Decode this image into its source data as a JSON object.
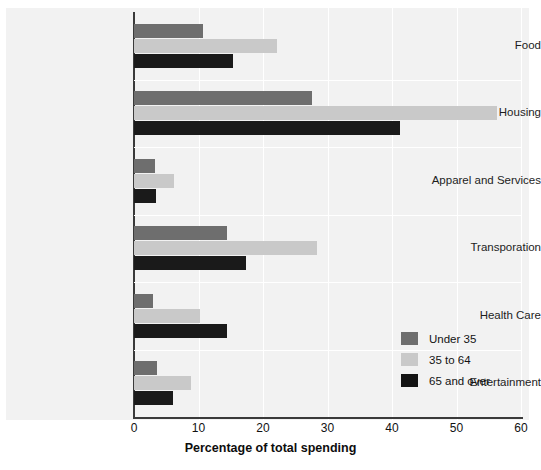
{
  "chart_data": {
    "type": "bar",
    "orientation": "horizontal",
    "title": "",
    "xlabel": "Percentage of total spending",
    "ylabel": "",
    "xlim": [
      0,
      60
    ],
    "xticks": [
      0,
      10,
      20,
      30,
      40,
      50,
      60
    ],
    "xtick_labels": [
      "0",
      "10",
      "20",
      "30",
      "40",
      "50",
      "60"
    ],
    "grid": true,
    "grid_axis": "x",
    "legend_position": "lower right",
    "categories": [
      "Food",
      "Housing",
      "Apparel and Services",
      "Transporation",
      "Health Care",
      "Entertainment"
    ],
    "series": [
      {
        "name": "Under 35",
        "color": "#6e6e6e",
        "values": [
          10.7,
          27.6,
          3.3,
          14.4,
          2.9,
          3.6
        ]
      },
      {
        "name": "35 to 64",
        "color": "#c9c9c9",
        "values": [
          22.2,
          56.3,
          6.2,
          28.4,
          10.2,
          8.8
        ]
      },
      {
        "name": "65 and over",
        "color": "#141414",
        "values": [
          15.3,
          41.2,
          3.4,
          17.4,
          14.4,
          6.1
        ]
      }
    ]
  },
  "legend": {
    "items": [
      {
        "label": "Under 35",
        "color": "#6e6e6e"
      },
      {
        "label": "35 to 64",
        "color": "#c9c9c9"
      },
      {
        "label": "65 and over",
        "color": "#141414"
      }
    ]
  }
}
